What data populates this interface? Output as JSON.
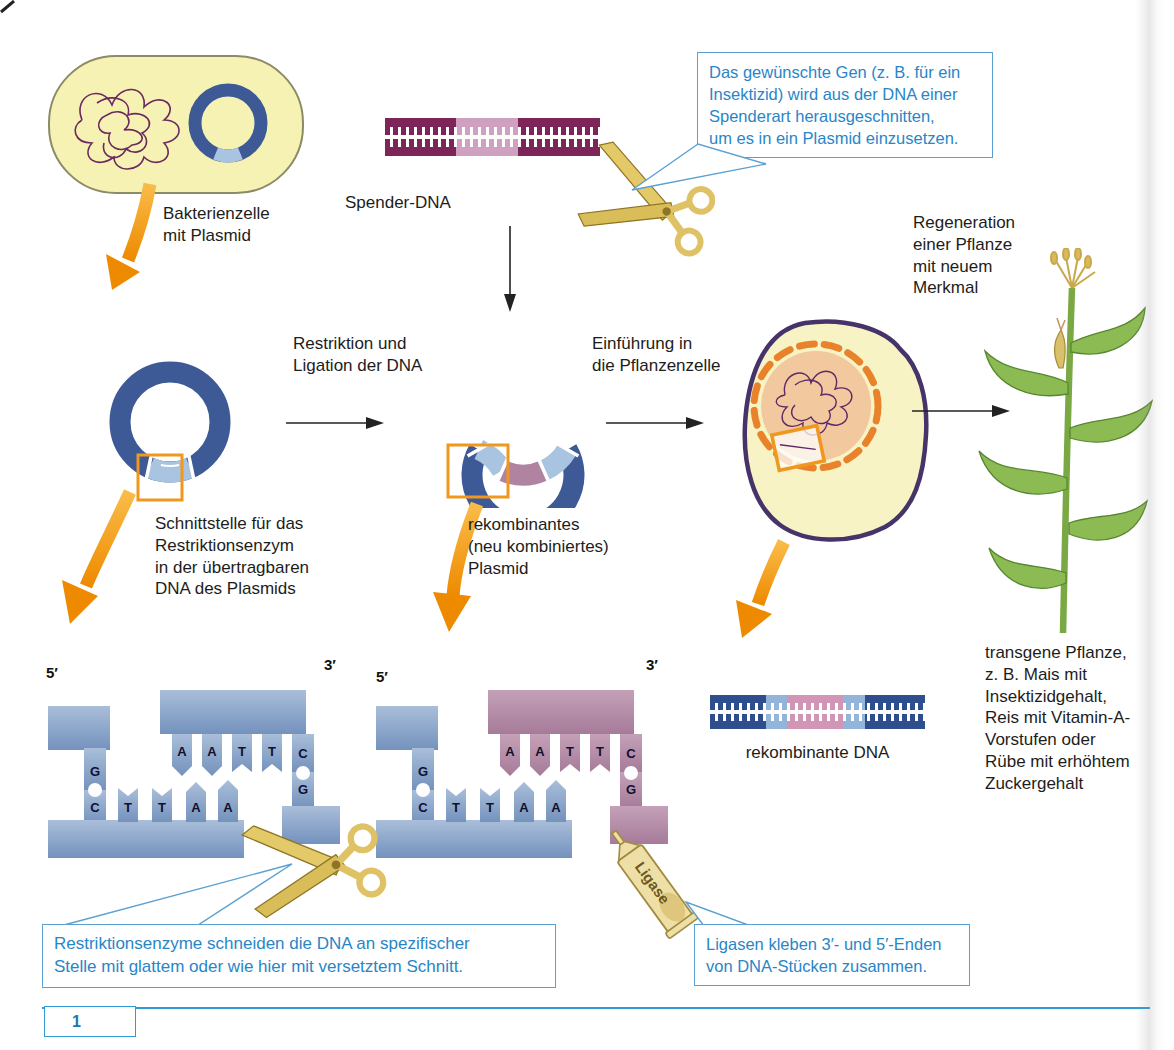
{
  "figure": {
    "number": "1"
  },
  "labels": {
    "bacteria": "Bakterienzelle\nmit Plasmid",
    "donor_dna": "Spender-DNA",
    "restriction_ligation": "Restriktion und\nLigation der DNA",
    "introduction": "Einführung in\ndie Pflanzenzelle",
    "regeneration": "Regeneration\neiner Pflanze\nmit neuem\nMerkmal",
    "cut_site": "Schnittstelle für das\nRestriktionsenzym\nin der übertragbaren\nDNA des Plasmids",
    "recombinant_plasmid": "rekombinantes\n(neu kombiniertes)\nPlasmid",
    "recombinant_dna": "rekombinante DNA",
    "transgenic_plant": "transgene Pflanze,\nz. B. Mais mit\nInsektizidgehalt,\nReis mit Vitamin-A-\nVorstufen oder\nRübe mit erhöhtem\nZuckergehalt",
    "ligase_tube": "Ligase"
  },
  "callouts": {
    "gene_excision": "Das gewünschte Gen (z. B. für ein\nInsektizid) wird aus der DNA einer\nSpenderart herausgeschnitten,\num es in ein Plasmid einzusetzen.",
    "restriction_enzymes": "Restriktionsenzyme schneiden die DNA an spezifischer\nStelle mit glattem oder wie hier mit versetztem Schnitt.",
    "ligases": "Ligasen kleben 3′- und 5′-Enden\nvon DNA-Stücken zusammen."
  },
  "dna_ends": {
    "five_prime": "5′",
    "three_prime": "3′",
    "left_g": "G",
    "top_bases": [
      "A",
      "A",
      "T",
      "T",
      "C"
    ],
    "bottom_bases": [
      "C",
      "T",
      "T",
      "A",
      "A"
    ],
    "right_g": "G"
  },
  "colors": {
    "plasmid_blue": "#3d5a96",
    "sticky_blue": "#7e9cc4",
    "insert_pink": "#b084a0",
    "light_blue_segment": "#a9c4e0",
    "donor_dna_purple": "#7d2458",
    "donor_dna_light": "#cfa0bf",
    "arrow_orange": "#f49b1f",
    "callout_blue": "#2886c8",
    "cell_yellow": "#f6f2b4",
    "plant_cell_border": "#46336a",
    "nucleus_peach": "#f2c89e",
    "nucleus_dash_orange": "#e8832c",
    "maize_green": "#8cbb53",
    "gold_tool": "#dfc265"
  }
}
